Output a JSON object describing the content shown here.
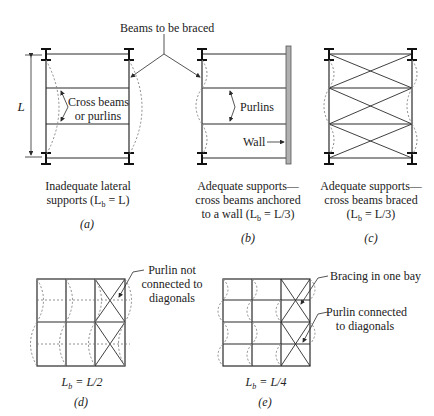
{
  "title_callout": "Beams to be braced",
  "panels": {
    "a": {
      "tag": "(a)",
      "dimension_label": "L",
      "callout_line1": "Cross beams",
      "callout_line2": "or purlins",
      "caption_line1": "Inadequate lateral",
      "caption_line2": "supports (L",
      "caption_sub": "b",
      "caption_end": " = L)"
    },
    "b": {
      "tag": "(b)",
      "callout_purlins": "Purlins",
      "callout_wall": "Wall",
      "caption_line1": "Adequate supports—",
      "caption_line2": "cross beams anchored",
      "caption_line3": "to a wall (L",
      "caption_sub": "b",
      "caption_end": " = L/3)"
    },
    "c": {
      "tag": "(c)",
      "caption_line1": "Adequate supports—",
      "caption_line2": "cross beams braced",
      "caption_line3": "(L",
      "caption_sub": "b",
      "caption_end": " = L/3)"
    },
    "d": {
      "tag": "(d)",
      "callout_line1": "Purlin not",
      "callout_line2": "connected to",
      "callout_line3": "diagonals",
      "caption": "L",
      "caption_sub": "b",
      "caption_end": " = L/2"
    },
    "e": {
      "tag": "(e)",
      "callout_bracing": "Bracing in one bay",
      "callout_purlin_line1": "Purlin connected",
      "callout_purlin_line2": "to diagonals",
      "caption": "L",
      "caption_sub": "b",
      "caption_end": " = L/4"
    }
  },
  "colors": {
    "line": "#2a2a2a",
    "buckle": "#8a8a8a",
    "wall_fill": "#b0b0b0"
  }
}
